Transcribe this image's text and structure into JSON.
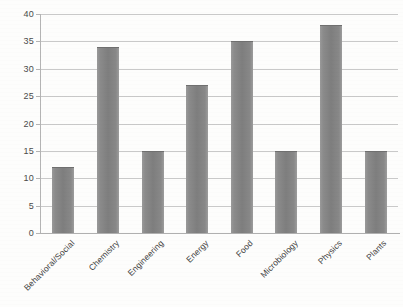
{
  "chart_data": {
    "type": "bar",
    "title": "",
    "xlabel": "",
    "ylabel": "",
    "ylim": [
      0,
      40
    ],
    "ytick_step": 5,
    "yticks": [
      40,
      35,
      30,
      25,
      20,
      15,
      10,
      5,
      0
    ],
    "grid": true,
    "legend": false,
    "categories": [
      "Behavioral/Social",
      "Chemistry",
      "Engineering",
      "Energy",
      "Food",
      "Microbiology",
      "Physics",
      "Plants"
    ],
    "values": [
      12,
      34,
      15,
      27,
      35,
      15,
      38,
      15
    ],
    "bar_color": "#808080",
    "gridline_color": "#c9c9c9",
    "axis_color": "#b0b0b0",
    "label_color": "#3f3f3f"
  }
}
